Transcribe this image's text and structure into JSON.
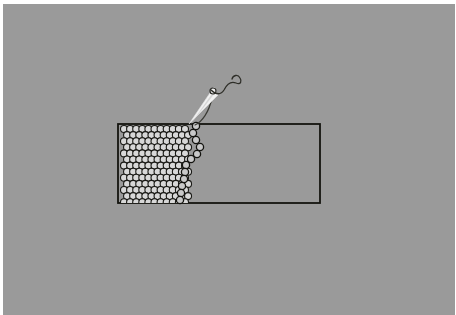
{
  "scene": {
    "title": "Colloidal monolayer manipulation schematic",
    "description": "Grayscale schematic showing a dense hexagonally packed array of spherical particles confined in a rectangular channel, with a needle-like probe pulling a single-file chain of particles out of the crystal.",
    "background_color": "#9a9a9a",
    "canvas_border_color": "#ffffff",
    "canvas": {
      "x": 3,
      "y": 4,
      "width": 452,
      "height": 311
    }
  },
  "channel": {
    "name": "rectangular-channel",
    "x": 118,
    "y": 124,
    "width": 202,
    "height": 79,
    "stroke": "#14140f",
    "stroke_width": 1.8,
    "fill": "none"
  },
  "particle_array": {
    "name": "hexagonal-particle-array",
    "columns": 11,
    "rows": 13,
    "radius": 3.5,
    "spacing_x": 6.1,
    "spacing_y": 6.1,
    "origin_x": 124,
    "origin_y": 129,
    "fill": "#d8d8d8",
    "stroke": "#1a1a16",
    "stroke_width": 1.1
  },
  "particle_chain": {
    "name": "extracted-particle-chain",
    "radius": 3.6,
    "fill": "#c9c9c9",
    "stroke": "#141410",
    "stroke_width": 1.3,
    "points": [
      {
        "x": 196,
        "y": 126
      },
      {
        "x": 193,
        "y": 133
      },
      {
        "x": 196,
        "y": 140
      },
      {
        "x": 200,
        "y": 147
      },
      {
        "x": 197,
        "y": 154
      },
      {
        "x": 191,
        "y": 159
      },
      {
        "x": 186,
        "y": 165
      },
      {
        "x": 185,
        "y": 172
      },
      {
        "x": 184,
        "y": 179
      },
      {
        "x": 182,
        "y": 186
      },
      {
        "x": 181,
        "y": 193
      },
      {
        "x": 180,
        "y": 200
      }
    ]
  },
  "probe": {
    "name": "needle-probe",
    "fill": "#f2f2f2",
    "stroke": "#efefef",
    "tip_x": 189,
    "tip_y": 124,
    "head_x": 214,
    "head_y": 92,
    "ring_cx": 213,
    "ring_cy": 91,
    "ring_r": 3.0,
    "ring_stroke": "#2a2a26"
  },
  "tether": {
    "name": "probe-tether-line",
    "stroke": "#3a3a34",
    "stroke_width": 1.2,
    "path": "M 195 125 C 202 122, 209 112, 212 98"
  },
  "squiggle": {
    "name": "optical-trap-squiggle",
    "stroke": "#2e2e28",
    "stroke_width": 1.3,
    "path": "M 211 90 C 216 95, 221 95, 224 90 C 227 84, 231 81, 236 83 C 241 85, 242 81, 240 78 C 238 74, 233 75, 232 79"
  }
}
